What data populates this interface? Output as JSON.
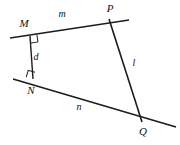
{
  "figure": {
    "background_color": "#ffffff",
    "stroke_color": "#1c1c1c",
    "label_color": "#101010",
    "width": 180,
    "height": 145
  },
  "labels": {
    "point_m": "M",
    "point_n": "N",
    "point_p": "P",
    "point_q": "Q",
    "line_m": "m",
    "line_n": "n",
    "line_l": "l",
    "segment_d": "d"
  },
  "chart_data": {
    "type": "diagram",
    "xlabel": "",
    "ylabel": "",
    "xlim": [
      0,
      180
    ],
    "ylim": [
      0,
      145
    ],
    "grid": false,
    "legend": "none",
    "points": [
      {
        "name": "M",
        "label": "M",
        "x": 30,
        "y": 36,
        "label_x": 24,
        "label_y": 27
      },
      {
        "name": "N",
        "label": "N",
        "x": 33,
        "y": 79,
        "label_x": 31,
        "label_y": 94
      },
      {
        "name": "P",
        "label": "P",
        "x": 109,
        "y": 19,
        "label_x": 110,
        "label_y": 12
      },
      {
        "name": "Q",
        "label": "Q",
        "x": 142,
        "y": 122,
        "label_x": 143,
        "label_y": 135
      }
    ],
    "segments": [
      {
        "name": "line-m",
        "label": "m",
        "x1": 10,
        "y1": 38,
        "x2": 129,
        "y2": 20,
        "width": 1.6,
        "label_x": 62,
        "label_y": 17
      },
      {
        "name": "line-n",
        "label": "n",
        "x1": 13,
        "y1": 79,
        "x2": 176,
        "y2": 127,
        "width": 1.6,
        "label_x": 79,
        "label_y": 110
      },
      {
        "name": "line-l",
        "label": "l",
        "x1": 109,
        "y1": 19,
        "x2": 142,
        "y2": 122,
        "width": 1.6,
        "label_x": 134,
        "label_y": 66
      },
      {
        "name": "segment-d",
        "label": "d",
        "x1": 30,
        "y1": 36,
        "x2": 33,
        "y2": 79,
        "width": 1.4,
        "label_x": 36,
        "label_y": 60
      }
    ],
    "right_angles": [
      {
        "name": "right-angle-at-m",
        "vertex_x": 30,
        "vertex_y": 36,
        "size": 7,
        "rotate": -8.6
      },
      {
        "name": "right-angle-at-n",
        "vertex_x": 33,
        "vertex_y": 79,
        "size": 7,
        "rotate": -164
      }
    ]
  }
}
